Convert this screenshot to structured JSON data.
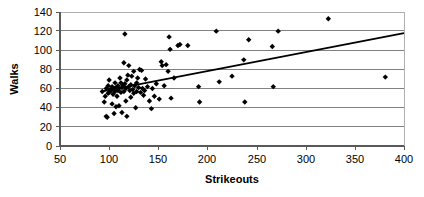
{
  "chart_data": {
    "type": "scatter",
    "title": "",
    "xlabel": "Strikeouts",
    "ylabel": "Walks",
    "xlim": [
      50,
      400
    ],
    "ylim": [
      0,
      140
    ],
    "xticks": [
      50,
      100,
      150,
      200,
      250,
      300,
      350,
      400
    ],
    "yticks": [
      0,
      20,
      40,
      60,
      80,
      100,
      120,
      140
    ],
    "xtick_labels": [
      "50",
      "100",
      "150",
      "200",
      "250",
      "300",
      "350",
      "400"
    ],
    "ytick_labels": [
      "0",
      "20",
      "40",
      "60",
      "80",
      "100",
      "120",
      "140"
    ],
    "grid": "horizontal",
    "legend": "none",
    "marker": "diamond",
    "marker_color": "#000000",
    "gridline_color": "#808080",
    "background_color": "#ffffff",
    "points": [
      [
        93,
        57
      ],
      [
        95,
        46
      ],
      [
        96,
        52
      ],
      [
        97,
        60
      ],
      [
        97,
        31
      ],
      [
        98,
        30
      ],
      [
        99,
        63
      ],
      [
        99,
        55
      ],
      [
        100,
        56
      ],
      [
        100,
        69
      ],
      [
        101,
        59
      ],
      [
        102,
        58
      ],
      [
        103,
        62
      ],
      [
        103,
        44
      ],
      [
        104,
        54
      ],
      [
        105,
        60
      ],
      [
        105,
        34
      ],
      [
        106,
        57
      ],
      [
        106,
        66
      ],
      [
        107,
        41
      ],
      [
        107,
        61
      ],
      [
        108,
        52
      ],
      [
        109,
        58
      ],
      [
        109,
        63
      ],
      [
        110,
        60
      ],
      [
        110,
        42
      ],
      [
        111,
        71
      ],
      [
        112,
        56
      ],
      [
        112,
        66
      ],
      [
        113,
        61
      ],
      [
        113,
        35
      ],
      [
        114,
        63
      ],
      [
        115,
        87
      ],
      [
        115,
        57
      ],
      [
        116,
        117
      ],
      [
        116,
        65
      ],
      [
        117,
        60
      ],
      [
        117,
        47
      ],
      [
        118,
        69
      ],
      [
        118,
        31
      ],
      [
        119,
        74
      ],
      [
        120,
        62
      ],
      [
        120,
        84
      ],
      [
        121,
        58
      ],
      [
        122,
        64
      ],
      [
        122,
        51
      ],
      [
        123,
        73
      ],
      [
        124,
        59
      ],
      [
        125,
        78
      ],
      [
        125,
        55
      ],
      [
        126,
        63
      ],
      [
        127,
        40
      ],
      [
        128,
        66
      ],
      [
        128,
        57
      ],
      [
        129,
        71
      ],
      [
        130,
        61
      ],
      [
        131,
        80
      ],
      [
        132,
        56
      ],
      [
        133,
        79
      ],
      [
        134,
        60
      ],
      [
        135,
        53
      ],
      [
        136,
        58
      ],
      [
        137,
        70
      ],
      [
        139,
        62
      ],
      [
        141,
        47
      ],
      [
        143,
        39
      ],
      [
        144,
        60
      ],
      [
        146,
        52
      ],
      [
        148,
        65
      ],
      [
        151,
        49
      ],
      [
        153,
        88
      ],
      [
        154,
        84
      ],
      [
        156,
        63
      ],
      [
        158,
        85
      ],
      [
        160,
        78
      ],
      [
        161,
        114
      ],
      [
        162,
        101
      ],
      [
        163,
        50
      ],
      [
        166,
        71
      ],
      [
        170,
        105
      ],
      [
        172,
        106
      ],
      [
        180,
        105
      ],
      [
        191,
        62
      ],
      [
        192,
        46
      ],
      [
        209,
        120
      ],
      [
        212,
        67
      ],
      [
        225,
        73
      ],
      [
        237,
        90
      ],
      [
        238,
        46
      ],
      [
        242,
        111
      ],
      [
        266,
        104
      ],
      [
        267,
        62
      ],
      [
        272,
        120
      ],
      [
        323,
        133
      ],
      [
        381,
        72
      ]
    ],
    "trendline": {
      "visible": true,
      "x_start": 93,
      "y_start": 57,
      "x_end": 400,
      "y_end": 118,
      "color": "#000000"
    }
  }
}
